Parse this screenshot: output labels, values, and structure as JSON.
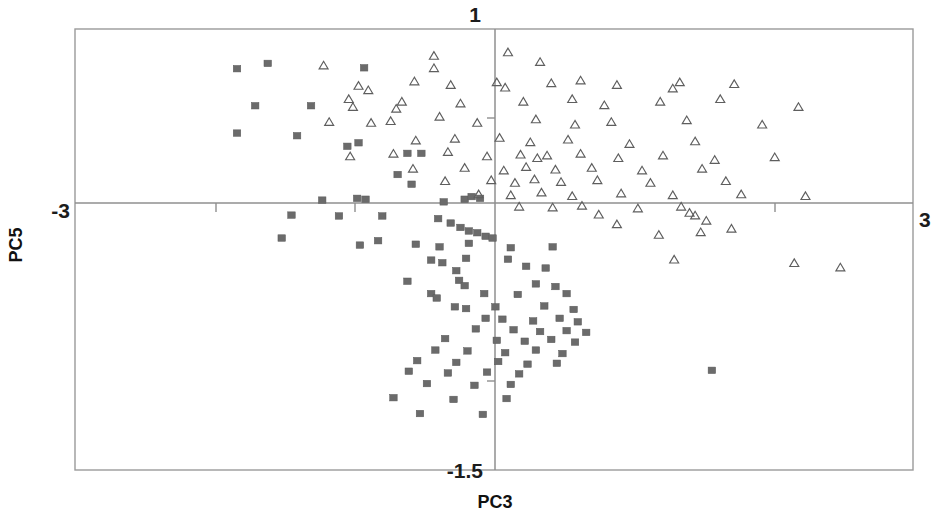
{
  "chart_data": {
    "type": "scatter",
    "title": "",
    "xlabel": "PC3",
    "ylabel": "PC5",
    "xlim": [
      -3,
      3
    ],
    "ylim": [
      -1.5,
      1
    ],
    "grid": false,
    "legend": "none",
    "axis_labels": {
      "x_left": "-3",
      "x_right": "3",
      "y_top": "1",
      "y_bottom": "-1.5"
    },
    "x_ticks": [
      -3,
      -1.5,
      0,
      1.5,
      3
    ],
    "y_ticks": [
      -1.5,
      0,
      0.5,
      1
    ],
    "origin_axes": true,
    "series": [
      {
        "name": "group-squares",
        "marker": "filled-square",
        "color": "#6b6b6b",
        "count": 98,
        "points": [
          [
            -1.84,
            0.775
          ],
          [
            -1.62,
            0.805
          ],
          [
            -0.93,
            0.78
          ],
          [
            -1.71,
            0.565
          ],
          [
            -1.31,
            0.565
          ],
          [
            -1.84,
            0.41
          ],
          [
            -1.41,
            0.395
          ],
          [
            -1.05,
            0.335
          ],
          [
            -0.97,
            0.355
          ],
          [
            -0.62,
            0.295
          ],
          [
            -0.52,
            0.295
          ],
          [
            -0.69,
            0.175
          ],
          [
            -1.23,
            0.03
          ],
          [
            -0.98,
            0.04
          ],
          [
            -0.92,
            0.035
          ],
          [
            -0.59,
            0.12
          ],
          [
            -0.36,
            0.02
          ],
          [
            -0.21,
            0.035
          ],
          [
            -0.16,
            0.05
          ],
          [
            -0.1,
            0.04
          ],
          [
            -1.45,
            -0.055
          ],
          [
            -1.11,
            -0.06
          ],
          [
            -0.8,
            -0.06
          ],
          [
            -0.4,
            -0.075
          ],
          [
            -0.31,
            -0.1
          ],
          [
            -0.24,
            -0.125
          ],
          [
            -0.18,
            -0.145
          ],
          [
            -0.12,
            -0.155
          ],
          [
            -0.06,
            -0.175
          ],
          [
            -0.01,
            -0.185
          ],
          [
            -1.52,
            -0.185
          ],
          [
            -0.83,
            -0.2
          ],
          [
            -0.96,
            -0.225
          ],
          [
            -0.56,
            -0.22
          ],
          [
            -0.39,
            -0.235
          ],
          [
            -0.18,
            -0.215
          ],
          [
            0.12,
            -0.24
          ],
          [
            0.42,
            -0.235
          ],
          [
            -0.45,
            -0.31
          ],
          [
            -0.37,
            -0.325
          ],
          [
            -0.2,
            -0.3
          ],
          [
            0.1,
            -0.305
          ],
          [
            -0.27,
            -0.37
          ],
          [
            0.23,
            -0.345
          ],
          [
            0.37,
            -0.355
          ],
          [
            -0.62,
            -0.43
          ],
          [
            -0.25,
            -0.425
          ],
          [
            -0.21,
            -0.455
          ],
          [
            0.3,
            -0.445
          ],
          [
            0.44,
            -0.46
          ],
          [
            -0.45,
            -0.5
          ],
          [
            -0.41,
            -0.525
          ],
          [
            -0.07,
            -0.5
          ],
          [
            0.17,
            -0.505
          ],
          [
            0.52,
            -0.5
          ],
          [
            -0.28,
            -0.575
          ],
          [
            -0.2,
            -0.585
          ],
          [
            0.01,
            -0.575
          ],
          [
            0.36,
            -0.57
          ],
          [
            0.57,
            -0.59
          ],
          [
            -0.06,
            -0.64
          ],
          [
            0.06,
            -0.645
          ],
          [
            0.28,
            -0.655
          ],
          [
            0.47,
            -0.64
          ],
          [
            0.6,
            -0.66
          ],
          [
            -0.13,
            -0.7
          ],
          [
            0.14,
            -0.705
          ],
          [
            0.33,
            -0.715
          ],
          [
            0.52,
            -0.71
          ],
          [
            0.66,
            -0.72
          ],
          [
            -0.35,
            -0.755
          ],
          [
            0.02,
            -0.765
          ],
          [
            0.22,
            -0.77
          ],
          [
            0.41,
            -0.76
          ],
          [
            0.58,
            -0.775
          ],
          [
            -0.42,
            -0.82
          ],
          [
            -0.19,
            -0.825
          ],
          [
            0.08,
            -0.835
          ],
          [
            0.3,
            -0.82
          ],
          [
            0.49,
            -0.84
          ],
          [
            -0.55,
            -0.88
          ],
          [
            -0.27,
            -0.89
          ],
          [
            0.03,
            -0.885
          ],
          [
            0.24,
            -0.9
          ],
          [
            0.45,
            -0.895
          ],
          [
            -0.61,
            -0.94
          ],
          [
            -0.33,
            -0.95
          ],
          [
            -0.05,
            -0.945
          ],
          [
            0.18,
            -0.955
          ],
          [
            1.56,
            -0.935
          ],
          [
            -0.48,
            -1.01
          ],
          [
            -0.14,
            -1.02
          ],
          [
            0.12,
            -1.015
          ],
          [
            -0.72,
            -1.09
          ],
          [
            -0.29,
            -1.1
          ],
          [
            0.09,
            -1.095
          ],
          [
            -0.53,
            -1.18
          ],
          [
            -0.08,
            -1.185
          ]
        ]
      },
      {
        "name": "group-triangles",
        "marker": "open-triangle",
        "color": "#5e5e5e",
        "count": 97,
        "points": [
          [
            -1.22,
            0.79
          ],
          [
            -0.43,
            0.845
          ],
          [
            -0.43,
            0.775
          ],
          [
            0.1,
            0.865
          ],
          [
            0.33,
            0.81
          ],
          [
            -0.97,
            0.675
          ],
          [
            -0.9,
            0.65
          ],
          [
            -0.57,
            0.7
          ],
          [
            -0.31,
            0.68
          ],
          [
            0.02,
            0.695
          ],
          [
            0.08,
            0.665
          ],
          [
            0.41,
            0.69
          ],
          [
            0.62,
            0.705
          ],
          [
            0.88,
            0.68
          ],
          [
            1.33,
            0.695
          ],
          [
            1.28,
            0.66
          ],
          [
            1.72,
            0.685
          ],
          [
            -1.04,
            0.6
          ],
          [
            -1.01,
            0.555
          ],
          [
            -0.66,
            0.585
          ],
          [
            -0.7,
            0.545
          ],
          [
            -0.24,
            0.575
          ],
          [
            0.21,
            0.585
          ],
          [
            0.56,
            0.6
          ],
          [
            0.79,
            0.565
          ],
          [
            1.19,
            0.585
          ],
          [
            1.62,
            0.6
          ],
          [
            2.18,
            0.555
          ],
          [
            -1.18,
            0.47
          ],
          [
            -0.88,
            0.465
          ],
          [
            -0.74,
            0.475
          ],
          [
            -0.39,
            0.5
          ],
          [
            -0.12,
            0.465
          ],
          [
            0.3,
            0.485
          ],
          [
            0.58,
            0.455
          ],
          [
            0.84,
            0.47
          ],
          [
            1.38,
            0.48
          ],
          [
            1.92,
            0.455
          ],
          [
            -0.56,
            0.365
          ],
          [
            -0.28,
            0.375
          ],
          [
            0.04,
            0.38
          ],
          [
            0.26,
            0.355
          ],
          [
            0.53,
            0.37
          ],
          [
            0.97,
            0.345
          ],
          [
            1.44,
            0.36
          ],
          [
            -1.03,
            0.275
          ],
          [
            -0.72,
            0.29
          ],
          [
            -0.33,
            0.3
          ],
          [
            -0.05,
            0.275
          ],
          [
            0.19,
            0.285
          ],
          [
            0.31,
            0.265
          ],
          [
            0.38,
            0.28
          ],
          [
            0.62,
            0.29
          ],
          [
            0.89,
            0.265
          ],
          [
            1.21,
            0.28
          ],
          [
            1.58,
            0.255
          ],
          [
            2.01,
            0.27
          ],
          [
            -0.58,
            0.205
          ],
          [
            -0.21,
            0.21
          ],
          [
            0.07,
            0.195
          ],
          [
            0.23,
            0.215
          ],
          [
            0.44,
            0.2
          ],
          [
            0.7,
            0.21
          ],
          [
            1.06,
            0.195
          ],
          [
            1.49,
            0.205
          ],
          [
            -0.35,
            0.135
          ],
          [
            -0.02,
            0.14
          ],
          [
            0.15,
            0.125
          ],
          [
            0.29,
            0.145
          ],
          [
            0.48,
            0.13
          ],
          [
            0.74,
            0.14
          ],
          [
            1.12,
            0.125
          ],
          [
            1.66,
            0.135
          ],
          [
            -0.11,
            0.06
          ],
          [
            0.12,
            0.055
          ],
          [
            0.34,
            0.07
          ],
          [
            0.56,
            0.05
          ],
          [
            0.91,
            0.065
          ],
          [
            1.28,
            0.055
          ],
          [
            1.77,
            0.06
          ],
          [
            2.23,
            0.05
          ],
          [
            0.18,
            -0.01
          ],
          [
            0.42,
            -0.015
          ],
          [
            0.63,
            -0.005
          ],
          [
            1.03,
            -0.02
          ],
          [
            1.34,
            -0.01
          ],
          [
            1.4,
            -0.045
          ],
          [
            1.44,
            -0.06
          ],
          [
            0.88,
            -0.11
          ],
          [
            1.52,
            -0.09
          ],
          [
            1.18,
            -0.17
          ],
          [
            1.48,
            -0.155
          ],
          [
            1.7,
            -0.135
          ],
          [
            1.29,
            -0.31
          ],
          [
            2.15,
            -0.33
          ],
          [
            2.48,
            -0.355
          ],
          [
            0.75,
            -0.055
          ]
        ]
      }
    ]
  },
  "axes_geometry": {
    "frame": {
      "left": 75,
      "top": 29,
      "right": 913,
      "bottom": 470
    },
    "origin": {
      "x": 495,
      "y": 203
    }
  }
}
